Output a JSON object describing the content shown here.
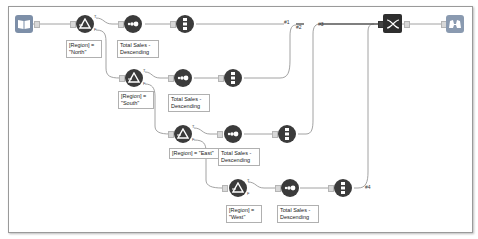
{
  "canvas": {
    "border_color": "#9a9a9a",
    "background": "#ffffff"
  },
  "tools": {
    "input": {
      "type": "Input Data",
      "icon": "book-icon"
    },
    "filters": [
      {
        "expression": "[Region] =\n\"North\"",
        "icon": "filter-icon"
      },
      {
        "expression": "[Region] =\n\"South\"",
        "icon": "filter-icon"
      },
      {
        "expression": "[Region] = \"East\"",
        "icon": "filter-icon"
      },
      {
        "expression": "[Region] =\n\"West\"",
        "icon": "filter-icon"
      }
    ],
    "sorts": [
      {
        "label": "Total Sales -\nDescending",
        "icon": "sort-icon"
      },
      {
        "label": "Total Sales -\nDescending",
        "icon": "sort-icon"
      },
      {
        "label": "Total Sales -\nDescending",
        "icon": "sort-icon"
      },
      {
        "label": "Total Sales -\nDescending",
        "icon": "sort-icon"
      }
    ],
    "samples": [
      {
        "icon": "sample-icon"
      },
      {
        "icon": "sample-icon"
      },
      {
        "icon": "sample-icon"
      },
      {
        "icon": "sample-icon"
      }
    ],
    "union": {
      "type": "Union",
      "icon": "union-icon"
    },
    "browse": {
      "type": "Browse",
      "icon": "binoculars-icon"
    }
  },
  "connection_tags": [
    "#1",
    "#2",
    "#3",
    "#4"
  ],
  "anchor_labels": {
    "true": "T",
    "false": "F"
  }
}
